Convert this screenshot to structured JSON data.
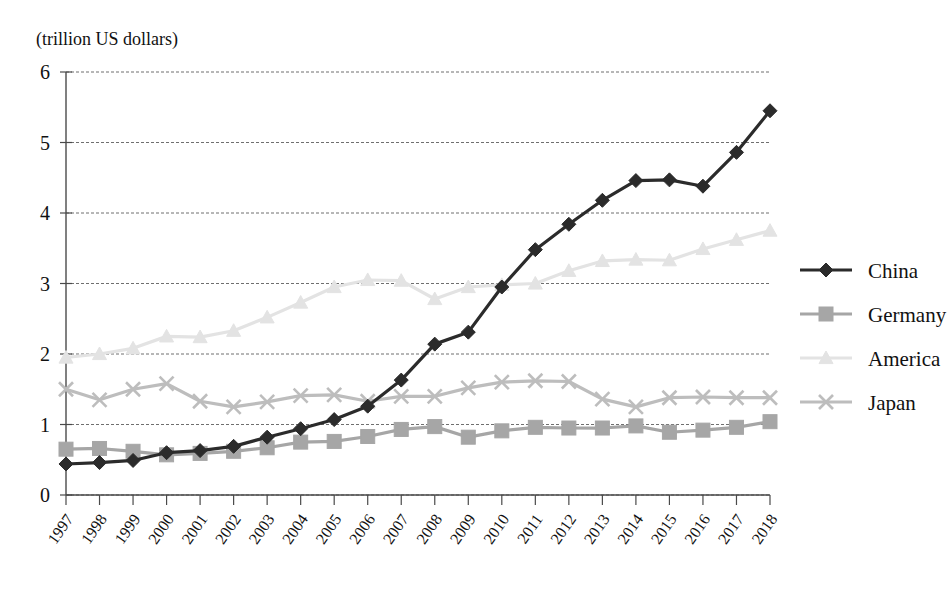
{
  "axis_unit_label": "(trillion US dollars)",
  "legend": {
    "position": "right",
    "items": [
      {
        "label": "China",
        "marker": "diamond-marker",
        "color": "#2b2b2b"
      },
      {
        "label": "Germany",
        "marker": "square-marker",
        "color": "#a6a6a6"
      },
      {
        "label": "America",
        "marker": "triangle-marker",
        "color": "#e3e3e3"
      },
      {
        "label": "Japan",
        "marker": "cross-marker",
        "color": "#bdbdbd"
      }
    ]
  },
  "chart_data": {
    "type": "line",
    "title": "",
    "subtitle": "",
    "xlabel": "",
    "ylabel": "(trillion US dollars)",
    "ylim": [
      0,
      6
    ],
    "ytick_step": 1,
    "yticks": [
      "0",
      "1",
      "2",
      "3",
      "4",
      "5",
      "6"
    ],
    "grid": true,
    "legend_position": "right",
    "categories": [
      "1997",
      "1998",
      "1999",
      "2000",
      "2001",
      "2002",
      "2003",
      "2004",
      "2005",
      "2006",
      "2007",
      "2008",
      "2009",
      "2010",
      "2011",
      "2012",
      "2013",
      "2014",
      "2015",
      "2016",
      "2017",
      "2018"
    ],
    "series": [
      {
        "name": "China",
        "marker": "diamond",
        "color": "#2b2b2b",
        "values": [
          0.44,
          0.46,
          0.49,
          0.6,
          0.63,
          0.69,
          0.82,
          0.94,
          1.07,
          1.26,
          1.63,
          2.14,
          2.31,
          2.95,
          3.48,
          3.84,
          4.18,
          4.46,
          4.47,
          4.38,
          4.86,
          5.45
        ]
      },
      {
        "name": "Germany",
        "marker": "square",
        "color": "#a6a6a6",
        "values": [
          0.65,
          0.66,
          0.62,
          0.57,
          0.59,
          0.62,
          0.67,
          0.75,
          0.76,
          0.83,
          0.93,
          0.97,
          0.82,
          0.91,
          0.96,
          0.95,
          0.95,
          0.98,
          0.89,
          0.92,
          0.96,
          1.04
        ]
      },
      {
        "name": "America",
        "marker": "triangle",
        "color": "#e3e3e3",
        "values": [
          1.95,
          2.0,
          2.08,
          2.25,
          2.24,
          2.33,
          2.52,
          2.73,
          2.95,
          3.05,
          3.04,
          2.78,
          2.95,
          2.98,
          3.0,
          3.18,
          3.32,
          3.34,
          3.33,
          3.49,
          3.62,
          3.75
        ]
      },
      {
        "name": "Japan",
        "marker": "cross",
        "color": "#bdbdbd",
        "values": [
          1.5,
          1.35,
          1.5,
          1.58,
          1.33,
          1.25,
          1.32,
          1.41,
          1.42,
          1.33,
          1.4,
          1.4,
          1.52,
          1.6,
          1.62,
          1.61,
          1.36,
          1.25,
          1.38,
          1.39,
          1.38,
          1.38
        ]
      }
    ]
  }
}
